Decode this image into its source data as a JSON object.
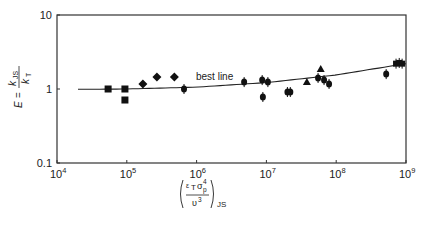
{
  "chart_data": {
    "type": "scatter",
    "title": "",
    "xlabel": "(ε_T σ_p^4 / υ^3)_JS",
    "ylabel": "E = k_JS / k_T",
    "xscale": "log",
    "yscale": "log",
    "xlim": [
      10000,
      1000000000
    ],
    "ylim": [
      0.1,
      10
    ],
    "grid": false,
    "legend": null,
    "x_ticks": [
      {
        "value": 10000,
        "base": "10",
        "exp": "4"
      },
      {
        "value": 100000,
        "base": "10",
        "exp": "5"
      },
      {
        "value": 1000000,
        "base": "10",
        "exp": "6"
      },
      {
        "value": 10000000,
        "base": "10",
        "exp": "7"
      },
      {
        "value": 100000000,
        "base": "10",
        "exp": "8"
      },
      {
        "value": 1000000000,
        "base": "10",
        "exp": "9"
      }
    ],
    "y_ticks": [
      {
        "value": 0.1,
        "label": "0.1"
      },
      {
        "value": 1,
        "label": "1"
      },
      {
        "value": 10,
        "label": "10"
      }
    ],
    "annotations": [
      {
        "text": "best line",
        "x": 2500000,
        "y": 1.33
      }
    ],
    "best_line": {
      "name": "best line",
      "x": [
        20000,
        100000,
        1000000,
        10000000,
        100000000,
        1000000000
      ],
      "y": [
        0.99,
        1.0,
        1.06,
        1.22,
        1.55,
        2.2
      ]
    },
    "series": [
      {
        "name": "squares",
        "marker": "square",
        "points": [
          {
            "x": 54000,
            "y": 1.0
          },
          {
            "x": 94000,
            "y": 1.0
          },
          {
            "x": 94000,
            "y": 0.71
          }
        ]
      },
      {
        "name": "diamonds",
        "marker": "diamond",
        "points": [
          {
            "x": 170000,
            "y": 1.17
          },
          {
            "x": 270000,
            "y": 1.45
          },
          {
            "x": 480000,
            "y": 1.45
          }
        ]
      },
      {
        "name": "circles",
        "marker": "circle",
        "points": [
          {
            "x": 660000,
            "y": 1.0
          },
          {
            "x": 4800000,
            "y": 1.24
          },
          {
            "x": 8700000,
            "y": 1.32
          },
          {
            "x": 8900000,
            "y": 0.78
          },
          {
            "x": 10500000,
            "y": 1.24
          },
          {
            "x": 20000000,
            "y": 0.91
          },
          {
            "x": 22000000,
            "y": 0.91
          },
          {
            "x": 55000000,
            "y": 1.41
          },
          {
            "x": 67000000,
            "y": 1.32
          },
          {
            "x": 79000000,
            "y": 1.17
          },
          {
            "x": 520000000,
            "y": 1.59
          }
        ]
      },
      {
        "name": "triangles",
        "marker": "triangle",
        "points": [
          {
            "x": 38000000,
            "y": 1.24
          },
          {
            "x": 60000000,
            "y": 1.86
          }
        ]
      },
      {
        "name": "crosses",
        "marker": "cross",
        "points": [
          {
            "x": 720000000,
            "y": 2.2
          },
          {
            "x": 800000000,
            "y": 2.25
          },
          {
            "x": 880000000,
            "y": 2.2
          }
        ]
      }
    ]
  },
  "labels": {
    "y_axis": {
      "E": "E",
      "eq": "=",
      "num": "k",
      "num_sub": "JS",
      "den": "k",
      "den_sub": "T"
    },
    "x_axis": {
      "num_eps": "ε",
      "num_eps_sub": "T",
      "num_sigma": "σ",
      "num_sigma_sup": "4",
      "num_sigma_sub": "p",
      "den": "υ",
      "den_sup": "3",
      "outer_sub": "JS"
    },
    "curve_label": "best line"
  }
}
